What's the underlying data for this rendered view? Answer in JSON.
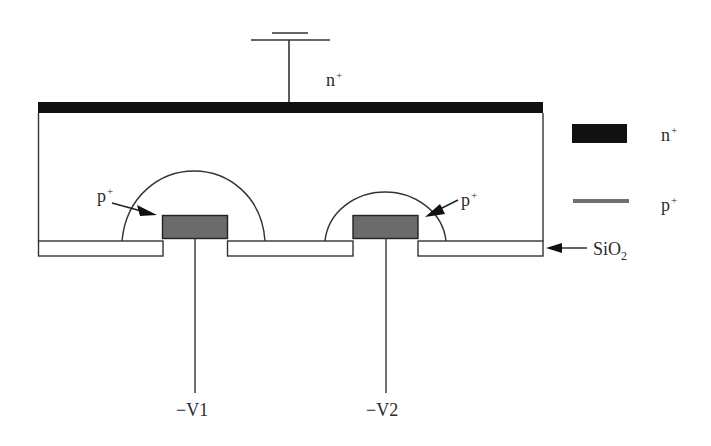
{
  "diagram": {
    "title": "",
    "labels": {
      "top_contact": {
        "base": "n",
        "sup": "+"
      },
      "left_pplus": {
        "base": "p",
        "sup": "+"
      },
      "right_pplus": {
        "base": "p",
        "sup": "+"
      },
      "oxide": {
        "base": "SiO",
        "sub": "2"
      },
      "v1": "−V1",
      "v2": "−V2"
    },
    "legend": [
      {
        "swatch": "n-plus-block",
        "base": "n",
        "sup": "+",
        "color": "#111111"
      },
      {
        "swatch": "p-plus-line",
        "base": "p",
        "sup": "+",
        "color": "#707070"
      }
    ],
    "colors": {
      "n_plus": "#111111",
      "p_plus": "#6b6b6b",
      "line": "#333333"
    }
  }
}
